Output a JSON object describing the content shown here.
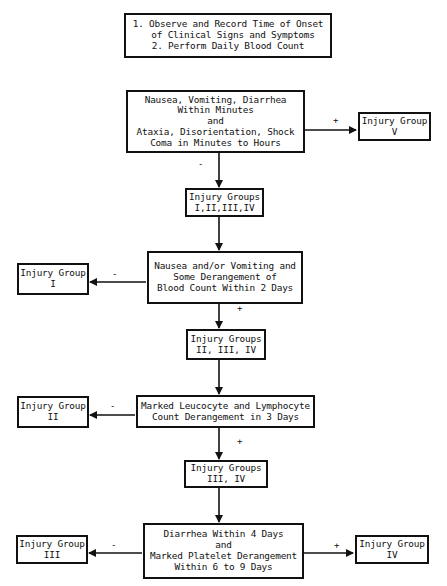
{
  "diagram": {
    "type": "decision-flowchart",
    "start_box": {
      "lines": [
        "1.  Observe and Record Time of Onset",
        "of Clinical Signs and Symptoms",
        "2.  Perform Daily Blood Count"
      ]
    },
    "decision_1": {
      "lines": [
        "Nausea, Vomiting, Diarrhea",
        "Within Minutes",
        "and",
        "Ataxia, Disorientation, Shock",
        "Coma in Minutes to Hours"
      ],
      "positive_label": "+",
      "negative_label": "-"
    },
    "result_group_v": {
      "lines": [
        "Injury Group",
        "V"
      ]
    },
    "groups_1_4": {
      "lines": [
        "Injury Groups",
        "I,II,III,IV"
      ]
    },
    "decision_2": {
      "lines": [
        "Nausea and/or Vomiting and",
        "Some Derangement of",
        "Blood Count Within 2 Days"
      ],
      "positive_label": "+",
      "negative_label": "-"
    },
    "result_group_i": {
      "lines": [
        "Injury Group",
        "I"
      ]
    },
    "groups_2_4": {
      "lines": [
        "Injury Groups",
        "II, III, IV"
      ]
    },
    "decision_3": {
      "lines": [
        "Marked Leucocyte and Lymphocyte",
        "Count Derangement in 3 Days"
      ],
      "positive_label": "+",
      "negative_label": "-"
    },
    "result_group_ii": {
      "lines": [
        "Injury Group",
        "II"
      ]
    },
    "groups_3_4": {
      "lines": [
        "Injury Groups",
        "III, IV"
      ]
    },
    "decision_4": {
      "lines": [
        "Diarrhea Within 4 Days",
        "and",
        "Marked Platelet Derangement",
        "Within 6 to 9 Days"
      ],
      "positive_label": "+",
      "negative_label": "-"
    },
    "result_group_iii": {
      "lines": [
        "Injury Group",
        "III"
      ]
    },
    "result_group_iv": {
      "lines": [
        "Injury Group",
        "IV"
      ]
    }
  },
  "colors": {
    "ink": "#111111",
    "background": "#ffffff"
  }
}
